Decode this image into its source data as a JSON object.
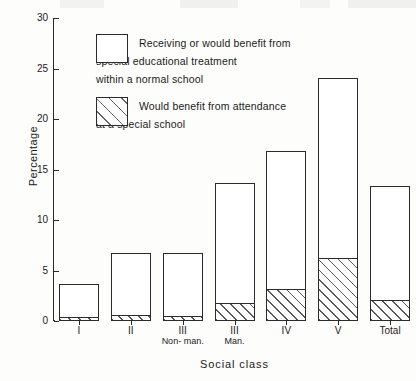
{
  "chart_data": {
    "type": "bar",
    "subtype": "stacked-bar",
    "title": "",
    "xlabel": "Social class",
    "ylabel": "Percentage",
    "ylim": [
      0,
      30
    ],
    "yticks": [
      0,
      5,
      10,
      15,
      20,
      25,
      30
    ],
    "grid": false,
    "legend_position": "upper-left-inside",
    "categories": [
      "I",
      "II",
      "III",
      "III",
      "IV",
      "V",
      "Total"
    ],
    "category_sublabels": [
      "",
      "",
      "Non-\nman.",
      "Man.",
      "",
      "",
      ""
    ],
    "series": [
      {
        "name": "Would benefit from attendance at a special school",
        "values": [
          0.3,
          0.6,
          0.5,
          1.8,
          3.2,
          6.2,
          2.1
        ],
        "fill": "diagonal-hatch"
      },
      {
        "name": "Receiving or would benefit from special educational treatment within a normal school",
        "values": [
          3.4,
          6.1,
          6.2,
          11.9,
          13.6,
          17.9,
          11.3
        ],
        "fill": "white"
      }
    ],
    "totals": [
      3.7,
      6.7,
      6.7,
      13.7,
      16.8,
      24.1,
      13.4
    ]
  },
  "axes": {
    "y_title": "Percentage",
    "x_title": "Social class",
    "y_tick_labels": [
      "0",
      "5",
      "10",
      "15",
      "20",
      "25",
      "30"
    ]
  },
  "legend": {
    "items": [
      {
        "swatch": "white-box",
        "label": "Receiving or would benefit from\nspecial educational treatment\nwithin a normal school"
      },
      {
        "swatch": "hatched-box",
        "label": "Would benefit from attendance\nat a special school"
      }
    ]
  },
  "colors": {
    "ink": "#2b2b2b",
    "paper": "#fdfdfb",
    "hatch": "#3c3c3c"
  }
}
